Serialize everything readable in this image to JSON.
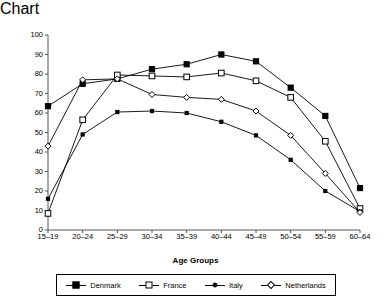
{
  "chart_data": {
    "type": "line",
    "title": "",
    "xlabel": "Age Groups",
    "ylabel": "Activity rate",
    "categories": [
      "15–19",
      "20–24",
      "25–29",
      "30–34",
      "35–39",
      "40–44",
      "45–49",
      "50–54",
      "55–59",
      "60–64"
    ],
    "ylim": [
      0,
      100
    ],
    "ytick_step": 10,
    "yticks": [
      0,
      10,
      20,
      30,
      40,
      50,
      60,
      70,
      80,
      90,
      100
    ],
    "grid": false,
    "legend_position": "bottom",
    "series": [
      {
        "name": "Denmark",
        "marker": "filled-square",
        "color": "#000000",
        "values": [
          63.5,
          75,
          77.5,
          82.5,
          85,
          90,
          86.5,
          73,
          58.5,
          21.5
        ]
      },
      {
        "name": "France",
        "marker": "open-square",
        "color": "#000000",
        "values": [
          8.5,
          56.5,
          79.5,
          79,
          78.5,
          80.5,
          76.5,
          68,
          45.5,
          11
        ]
      },
      {
        "name": "Italy",
        "marker": "small-filled-dot",
        "color": "#000000",
        "values": [
          16,
          49,
          60.5,
          61,
          60,
          55.5,
          48.5,
          36,
          20,
          9.5
        ]
      },
      {
        "name": "Netherlands",
        "marker": "open-diamond",
        "color": "#000000",
        "values": [
          43,
          77,
          77.5,
          69.5,
          68,
          67,
          61,
          48.5,
          29,
          9
        ]
      }
    ]
  }
}
